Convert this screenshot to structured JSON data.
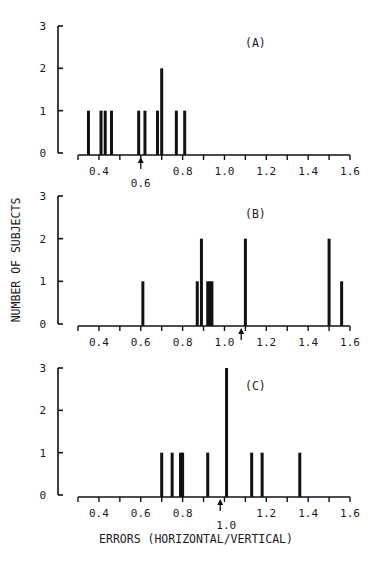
{
  "figure": {
    "ylabel": "NUMBER OF SUBJECTS",
    "xlabel": "ERRORS (HORIZONTAL/VERTICAL)"
  },
  "chart_data": [
    {
      "type": "bar",
      "panel": "(A)",
      "xlabel": "ERRORS (HORIZONTAL/VERTICAL)",
      "ylabel": "NUMBER OF SUBJECTS",
      "xlim": [
        0.3,
        1.6
      ],
      "ylim": [
        0,
        3
      ],
      "xticks": [
        0.4,
        0.6,
        0.8,
        1.0,
        1.2,
        1.4,
        1.6
      ],
      "xtick_labels": [
        "0.4",
        "0.6",
        "0.8",
        "1.0",
        "1.2",
        "1.4",
        "1.6"
      ],
      "yticks": [
        0,
        1,
        2,
        3
      ],
      "x": [
        0.35,
        0.41,
        0.43,
        0.46,
        0.59,
        0.62,
        0.68,
        0.7,
        0.77,
        0.81
      ],
      "values": [
        1,
        1,
        1,
        1,
        1,
        1,
        1,
        2,
        1,
        1
      ],
      "arrow_at": 0.6,
      "arrow_label": "0.6"
    },
    {
      "type": "bar",
      "panel": "(B)",
      "xlabel": "ERRORS (HORIZONTAL/VERTICAL)",
      "ylabel": "NUMBER OF SUBJECTS",
      "xlim": [
        0.3,
        1.6
      ],
      "ylim": [
        0,
        3
      ],
      "xticks": [
        0.4,
        0.6,
        0.8,
        1.0,
        1.2,
        1.4,
        1.6
      ],
      "xtick_labels": [
        "0.4",
        "0.6",
        "0.8",
        "1.0",
        "1.2",
        "1.4",
        "1.6"
      ],
      "yticks": [
        0,
        1,
        2,
        3
      ],
      "x": [
        0.61,
        0.87,
        0.89,
        0.92,
        0.93,
        0.94,
        1.1,
        1.5,
        1.56
      ],
      "values": [
        1,
        1,
        2,
        1,
        1,
        1,
        2,
        2,
        1
      ],
      "arrow_at": 1.08,
      "arrow_label": ""
    },
    {
      "type": "bar",
      "panel": "(C)",
      "xlabel": "ERRORS (HORIZONTAL/VERTICAL)",
      "ylabel": "NUMBER OF SUBJECTS",
      "xlim": [
        0.3,
        1.6
      ],
      "ylim": [
        0,
        3
      ],
      "xticks": [
        0.4,
        0.6,
        0.8,
        1.0,
        1.2,
        1.4,
        1.6
      ],
      "xtick_labels": [
        "0.4",
        "0.6",
        "0.8",
        "1.0",
        "1.2",
        "1.4",
        "1.6"
      ],
      "yticks": [
        0,
        1,
        2,
        3
      ],
      "x": [
        0.7,
        0.75,
        0.79,
        0.8,
        0.92,
        1.01,
        1.13,
        1.18,
        1.36
      ],
      "values": [
        1,
        1,
        1,
        1,
        1,
        3,
        1,
        1,
        1
      ],
      "arrow_at": 0.98,
      "arrow_label": "1.0"
    }
  ],
  "layout": {
    "panels": [
      {
        "baseline_y": 153,
        "top_y": 26,
        "label_x": 245,
        "label_y": 47,
        "axis_label_shift": 0
      },
      {
        "baseline_y": 324,
        "top_y": 196,
        "label_x": 245,
        "label_y": 218,
        "axis_label_shift": 0
      },
      {
        "baseline_y": 495,
        "top_y": 368,
        "label_x": 245,
        "label_y": 390,
        "axis_label_shift": 0
      }
    ],
    "x_axis_px": [
      78,
      350
    ],
    "x_axis_val": [
      0.3,
      1.6
    ],
    "y_axis_x": 58,
    "bar_width": 3,
    "ink": "#111111"
  }
}
